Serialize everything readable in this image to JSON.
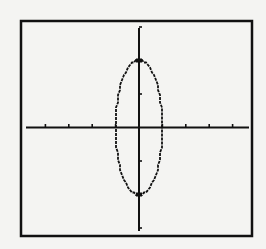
{
  "chart_data": {
    "type": "line",
    "title": "",
    "xlabel": "",
    "ylabel": "",
    "equation": "x^2 + y^2/4 = 1",
    "xlim": [
      -5,
      5
    ],
    "ylim": [
      -3,
      3
    ],
    "xscl": 1,
    "yscl": 1,
    "grid": false,
    "series": [
      {
        "name": "ellipse",
        "center": [
          0,
          0
        ],
        "semi_axis_x": 1,
        "semi_axis_y": 2,
        "vertices": [
          [
            0,
            2
          ],
          [
            0,
            -2
          ]
        ],
        "co_vertices": [
          [
            -1,
            0
          ],
          [
            1,
            0
          ]
        ]
      }
    ],
    "x_ticks": [
      -4,
      -3,
      -2,
      -1,
      1,
      2,
      3,
      4
    ],
    "y_ticks": [
      -3,
      -2,
      -1,
      1,
      2,
      3
    ]
  },
  "colors": {
    "background": "#f4f4f2",
    "ink": "#111111"
  }
}
